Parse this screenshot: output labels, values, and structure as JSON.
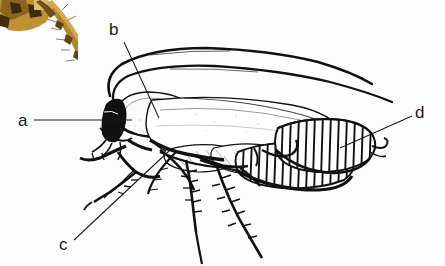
{
  "figure": {
    "background_color": "#fdfdfd",
    "ink_color": "#111111",
    "width": 445,
    "height": 266,
    "labels": [
      {
        "id": "a",
        "text": "a",
        "text_x": 18,
        "text_y": 126,
        "leader": "M 34 120 L 132 120",
        "target": "head"
      },
      {
        "id": "b",
        "text": "b",
        "text_x": 115,
        "text_y": 35,
        "leader": "M 124 42 L 159 118",
        "target": "pronotum"
      },
      {
        "id": "c",
        "text": "c",
        "text_x": 61,
        "text_y": 250,
        "leader": "M 74 240 L 170 150",
        "target": "leg"
      },
      {
        "id": "d",
        "text": "d",
        "text_x": 415,
        "text_y": 118,
        "leader": "M 413 116 L 340 148",
        "target": "ootheca"
      }
    ],
    "corner_photo": {
      "present": true,
      "description": "partial colour photograph of an insect leg at top-left corner",
      "colors": [
        "#b98a2e",
        "#d8ab55",
        "#6b4a18",
        "#3c2a10",
        "#e8c87f"
      ]
    }
  }
}
